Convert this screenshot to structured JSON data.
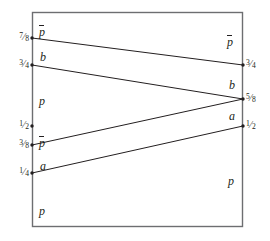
{
  "figure": {
    "name": "interval-map-diagram",
    "colors": {
      "stroke": "#6d6e71",
      "line": "#231f20",
      "text": "#231f20",
      "background": "#ffffff"
    },
    "frame": {
      "left": 32,
      "top": 12,
      "right": 243,
      "bottom": 227
    },
    "axes": {
      "left_x": 32,
      "right_x": 243
    },
    "left_ticks": [
      {
        "id": "left-7-8",
        "value": "7/8",
        "num": "7",
        "sol": "⁄",
        "den": "8",
        "y": 38
      },
      {
        "id": "left-3-4",
        "value": "3/4",
        "num": "3",
        "sol": "⁄",
        "den": "4",
        "y": 65
      },
      {
        "id": "left-1-2",
        "value": "1/2",
        "num": "1",
        "sol": "⁄",
        "den": "2",
        "y": 126
      },
      {
        "id": "left-3-8",
        "value": "3/8",
        "num": "3",
        "sol": "⁄",
        "den": "8",
        "y": 145
      },
      {
        "id": "left-1-4",
        "value": "1/4",
        "num": "1",
        "sol": "⁄",
        "den": "4",
        "y": 173
      }
    ],
    "right_ticks": [
      {
        "id": "right-3-4",
        "value": "3/4",
        "num": "3",
        "sol": "⁄",
        "den": "4",
        "y": 65
      },
      {
        "id": "right-5-8",
        "value": "5/8",
        "num": "5",
        "sol": "⁄",
        "den": "8",
        "y": 99
      },
      {
        "id": "right-1-2",
        "value": "1/2",
        "num": "1",
        "sol": "⁄",
        "den": "2",
        "y": 126
      }
    ],
    "left_interval_labels": [
      {
        "id": "left-label-pbar-top",
        "text": "p",
        "overbar": true,
        "x": 39,
        "y": 26
      },
      {
        "id": "left-label-b",
        "text": "b",
        "overbar": false,
        "x": 40,
        "y": 51
      },
      {
        "id": "left-label-p-mid",
        "text": "p",
        "overbar": false,
        "x": 39,
        "y": 95
      },
      {
        "id": "left-label-pbar-lower",
        "text": "p",
        "overbar": true,
        "x": 39,
        "y": 137
      },
      {
        "id": "left-label-a",
        "text": "a",
        "overbar": false,
        "x": 40,
        "y": 160
      },
      {
        "id": "left-label-p-bottom",
        "text": "p",
        "overbar": false,
        "x": 39,
        "y": 205
      }
    ],
    "right_interval_labels": [
      {
        "id": "right-label-pbar",
        "text": "p",
        "overbar": true,
        "x": 227,
        "y": 36
      },
      {
        "id": "right-label-b",
        "text": "b",
        "overbar": false,
        "x": 229,
        "y": 79
      },
      {
        "id": "right-label-a",
        "text": "a",
        "overbar": false,
        "x": 229,
        "y": 110
      },
      {
        "id": "right-label-p",
        "text": "p",
        "overbar": false,
        "x": 228,
        "y": 175
      }
    ],
    "segments": [
      {
        "id": "segment-7-8-to-3-4",
        "from_label": "7/8",
        "to_label": "3/4",
        "x1": 32,
        "y1": 38,
        "x2": 243,
        "y2": 65
      },
      {
        "id": "segment-3-4-to-5-8",
        "from_label": "3/4",
        "to_label": "5/8",
        "x1": 32,
        "y1": 65,
        "x2": 243,
        "y2": 99
      },
      {
        "id": "segment-3-8-to-5-8",
        "from_label": "3/8",
        "to_label": "5/8",
        "x1": 32,
        "y1": 145,
        "x2": 243,
        "y2": 99
      },
      {
        "id": "segment-1-4-to-1-2",
        "from_label": "1/4",
        "to_label": "1/2",
        "x1": 32,
        "y1": 173,
        "x2": 243,
        "y2": 126
      }
    ],
    "endpoint_dots": [
      {
        "id": "dot-left-7-8",
        "x": 32,
        "y": 38
      },
      {
        "id": "dot-left-3-4",
        "x": 32,
        "y": 65
      },
      {
        "id": "dot-left-1-2",
        "x": 32,
        "y": 126
      },
      {
        "id": "dot-left-3-8",
        "x": 32,
        "y": 145
      },
      {
        "id": "dot-left-1-4",
        "x": 32,
        "y": 173
      },
      {
        "id": "dot-right-3-4",
        "x": 243,
        "y": 65
      },
      {
        "id": "dot-right-5-8",
        "x": 243,
        "y": 99
      },
      {
        "id": "dot-right-1-2",
        "x": 243,
        "y": 126
      }
    ]
  }
}
